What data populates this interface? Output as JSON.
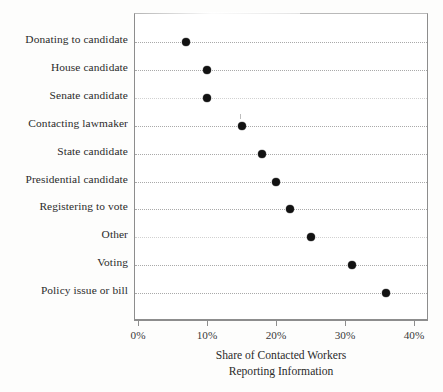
{
  "chart_data": {
    "type": "scatter",
    "plot_style": "dot-plot",
    "title": "",
    "subtitle": "",
    "xlabel": "Share of Contacted Workers Reporting Information",
    "xlabel_lines": [
      "Share of Contacted Workers",
      "Reporting Information"
    ],
    "ylabel": "",
    "categories": [
      "Donating to candidate",
      "House candidate",
      "Senate candidate",
      "Contacting lawmaker",
      "State candidate",
      "Presidential candidate",
      "Registering to vote",
      "Other",
      "Voting",
      "Policy issue or bill"
    ],
    "values": [
      7,
      10,
      10,
      15,
      18,
      20,
      22,
      25,
      31,
      36
    ],
    "value_unit": "percent",
    "xlim": [
      0,
      42.6
    ],
    "xticks": [
      0,
      10,
      20,
      30,
      40
    ],
    "xticklabels": [
      "0%",
      "10%",
      "20%",
      "30%",
      "40%"
    ],
    "grid": "horizontal-dotted",
    "legend": "none",
    "marker": {
      "shape": "circle",
      "color": "#121212",
      "size_px": 8
    }
  },
  "figure": {
    "background_color": "#ffffff",
    "frame_color": "#8d8d8d",
    "gridline_color": "#9b9b9b",
    "text_color": "#2b2b2b"
  }
}
